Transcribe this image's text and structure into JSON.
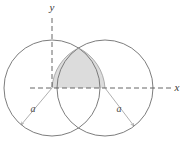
{
  "figure": {
    "canvas": {
      "width": 185,
      "height": 148,
      "background": "#ffffff"
    },
    "axes": {
      "x_axis": {
        "label": "x",
        "style": "dashed",
        "color": "#555555",
        "y_position": 88,
        "x_start": 30,
        "x_end": 172,
        "label_x": 177,
        "label_y": 91
      },
      "y_axis": {
        "label": "y",
        "style": "dashed",
        "color": "#555555",
        "x_position": 52,
        "y_start": 18,
        "y_end": 88,
        "label_x": 52,
        "label_y": 11
      }
    },
    "circles": [
      {
        "name": "left-circle",
        "center_x": 52,
        "center_y": 88,
        "radius": 48,
        "stroke": "#6e6e6e",
        "fill": "none"
      },
      {
        "name": "right-circle",
        "center_x": 105,
        "center_y": 88,
        "radius": 48,
        "stroke": "#6e6e6e",
        "fill": "none"
      }
    ],
    "shaded_region": {
      "name": "lens-upper-half",
      "description": "Upper half of the intersection (vesica) of the two circles, bounded below by the x-axis",
      "fill": "#dcdcdc",
      "stroke": "#9a9a9a"
    },
    "radius_indicators": [
      {
        "name": "left-radius",
        "label": "a",
        "from_x": 52,
        "from_y": 88,
        "to_x": 21,
        "to_y": 125,
        "label_x": 33,
        "label_y": 112,
        "color": "#8c8c8c"
      },
      {
        "name": "right-radius",
        "label": "a",
        "from_x": 105,
        "from_y": 88,
        "to_x": 134,
        "to_y": 126,
        "label_x": 119,
        "label_y": 112,
        "color": "#8c8c8c"
      }
    ],
    "intersection_points": [
      {
        "name": "top-intersection",
        "x": 78.5,
        "y": 40
      },
      {
        "name": "bottom-intersection",
        "x": 78.5,
        "y": 136
      }
    ]
  }
}
